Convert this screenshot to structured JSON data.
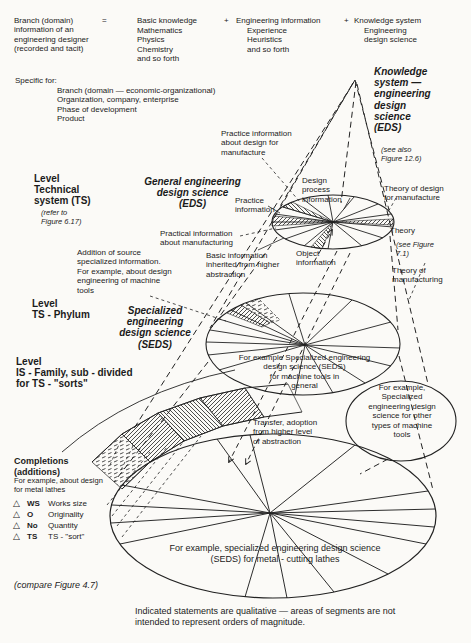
{
  "formula": {
    "lhs": "Branch (domain)\ninformation of an\nengineering designer\n(recorded and tacit)",
    "eq": "=",
    "plus1": "+",
    "plus2": "+",
    "term1_head": "Basic knowledge",
    "term1_items": "Mathematics\nPhysics\nChemistry\nand so forth",
    "term2_head": "Engineering information",
    "term2_items": "Experience\nHeuristics\nand so forth",
    "term3_head": "Knowledge system",
    "term3_items": "Engineering\ndesign science"
  },
  "specific": {
    "title": "Specific for:",
    "items": "Branch (domain — economic-organizational)\nOrganization, company, enterprise\nPhase of development\nProduct"
  },
  "right_col": {
    "knowledge_system": "Knowledge\nsystem —\nengineering\ndesign\nscience\n(EDS)",
    "see_also": "(see also\nFigure 12.6)"
  },
  "levels": {
    "ts_title": "Level\nTechnical\nsystem    (TS)",
    "ts_ref": "(refer to\nFigure 6.17)",
    "ts_science": "General engineering\ndesign science\n(EDS)",
    "phylum_title": "Level\nTS - Phylum",
    "phylum_science": "Specialized\nengineering\ndesign science\n(SEDS)",
    "family_title": "Level\nIS - Family, sub - divided\nfor TS - \"sorts\""
  },
  "annotations": {
    "practice_design_manufacture": "Practice information\nabout design for\nmanufacture",
    "design_process_info": "Design\nprocess\ninformation",
    "theory_design_manufacture": "Theory of design\nfor manufacture",
    "practice_information": "Practice\ninformation",
    "practical_info_manufacturing": "Practical information\nabout manufacturing",
    "theory": "Theory",
    "see_figure_71": "(see Figure\n7.1)",
    "object_information": "Object\ninformation",
    "basic_information": "Basic information\ninherited from higher\nabstraction",
    "addition_source": "Addition of source\nspecialized information.\nFor example, about design\nengineering of machine\ntools",
    "theory_manufacturing": "Theory of\nmanufacturing",
    "transfer": "Transfer, adoption\nfrom higher level\nof abstraction",
    "compare": "(compare Figure 4.7)"
  },
  "ellipse_labels": {
    "middle": "For example Specialized  engineering\ndesign science (SEDS)\nfor machine tools in\ngeneral",
    "bubble": "For example,\nSpecialized\nengineering design\nscience for other\ntypes of machine\ntools",
    "bottom": "For example, specialized  engineering  design  science\n(SEDS) for  metal - cutting  lathes"
  },
  "legend": {
    "title": "Completions\n(additions)",
    "subtitle": "For example, about design\nfor metal lathes",
    "rows": [
      {
        "symbol": "△",
        "code": "WS",
        "label": "Works size"
      },
      {
        "symbol": "△",
        "code": "O",
        "label": "Originality"
      },
      {
        "symbol": "△",
        "code": "No",
        "label": "Quantity"
      },
      {
        "symbol": "△",
        "code": "TS",
        "label": "TS - \"sort\""
      }
    ]
  },
  "caption": "Indicated statements are qualitative — areas of segments are not\nintended to represent orders of magnitude.",
  "colors": {
    "ink": "#1b1b1b",
    "bg": "#fbfaf7"
  }
}
